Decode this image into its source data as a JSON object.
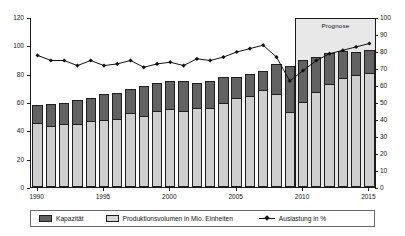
{
  "chart_data": {
    "type": "bar",
    "title": "",
    "xlabel": "",
    "ylabel": "",
    "categories": [
      1990,
      1991,
      1992,
      1993,
      1994,
      1995,
      1996,
      1997,
      1998,
      1999,
      2000,
      2001,
      2002,
      2003,
      2004,
      2005,
      2006,
      2007,
      2008,
      2009,
      2010,
      2011,
      2012,
      2013,
      2014,
      2015
    ],
    "x_tick_labels": [
      "1990",
      "1995",
      "2000",
      "2005",
      "2010",
      "2015"
    ],
    "x_tick_values": [
      1990,
      1995,
      2000,
      2005,
      2010,
      2015
    ],
    "y_left": {
      "label": "",
      "ylim": [
        0,
        120
      ],
      "ticks": [
        0,
        20,
        40,
        60,
        80,
        100,
        120
      ],
      "tick_labels": [
        "0",
        "20",
        "40",
        "60",
        "80",
        "100",
        "120"
      ]
    },
    "y_right": {
      "label": "",
      "ylim": [
        0,
        100
      ],
      "ticks": [
        0,
        10,
        20,
        30,
        40,
        50,
        60,
        70,
        80,
        90,
        100
      ],
      "tick_labels": [
        "0",
        "10",
        "20",
        "30",
        "40",
        "50",
        "60",
        "70",
        "80",
        "90",
        "100"
      ]
    },
    "grid": false,
    "legend_position": "bottom",
    "series": [
      {
        "name": "Kapazität",
        "type": "bar",
        "stack": "total-capacity",
        "axis": "left",
        "color": "#626262",
        "values": [
          58,
          58.5,
          59.5,
          61.5,
          62.5,
          65.5,
          66.5,
          69.5,
          71.5,
          73.5,
          75,
          74.5,
          73.5,
          75,
          77.5,
          78,
          79.5,
          82,
          86.5,
          85.5,
          89.5,
          91.5,
          94.5,
          96,
          95.5,
          96.5
        ]
      },
      {
        "name": "Produktionsvolumen in Mio. Einheiten",
        "type": "bar",
        "stack": "production",
        "axis": "left",
        "color": "#cfcfcf",
        "values": [
          45.5,
          43,
          44.5,
          44.5,
          46.5,
          47,
          48,
          52.5,
          50,
          53.5,
          55,
          53.5,
          55.5,
          56,
          59,
          62.5,
          64.5,
          68.5,
          65.5,
          53,
          60,
          67,
          73,
          77,
          79,
          80.5
        ]
      },
      {
        "name": "Auslastung in %",
        "type": "line",
        "axis": "right",
        "color": "#111111",
        "marker": "diamond",
        "values": [
          78,
          75,
          75,
          72,
          75,
          72,
          73,
          75,
          71,
          73,
          74,
          72,
          76,
          75,
          77,
          80,
          82,
          84,
          77,
          63,
          69,
          75,
          79,
          81,
          83,
          85
        ]
      }
    ],
    "annotations": [
      {
        "name": "prognose-region",
        "text": "Prognose",
        "start_category": 2010,
        "end_category": 2015,
        "fill": "#e8e8e8",
        "top_value": 120
      }
    ]
  },
  "legend": {
    "items": [
      {
        "label": "Kapazität",
        "marker": "filled-square"
      },
      {
        "label": "Produktionsvolumen in Mio. Einheiten",
        "marker": "hollow-square"
      },
      {
        "label": "Auslastung in %",
        "marker": "line-diamond"
      }
    ]
  }
}
